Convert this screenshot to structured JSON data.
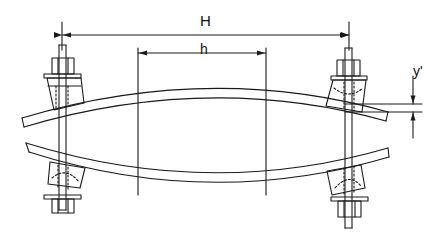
{
  "diagram": {
    "type": "technical-drawing",
    "labels": {
      "H": "H",
      "h": "h",
      "y_prime": "y'"
    },
    "dimensions": [
      {
        "name": "H",
        "description": "distance between bolt axes",
        "from_x": 62,
        "to_x": 349,
        "y": 35
      },
      {
        "name": "h",
        "description": "distance between inner vertical reference lines",
        "from_x": 138,
        "to_x": 266,
        "y": 53
      },
      {
        "name": "y'",
        "description": "vertical offset/deflection at right end",
        "x": 413,
        "from_y": 104,
        "to_y": 114
      }
    ],
    "components": [
      "upper-leaf-spring",
      "lower-leaf-spring",
      "left-upper-clamp",
      "left-lower-clamp",
      "right-upper-clamp",
      "right-lower-clamp",
      "left-bolt",
      "right-bolt"
    ],
    "colors": {
      "line": "#1a1a1a",
      "background": "#ffffff"
    }
  }
}
